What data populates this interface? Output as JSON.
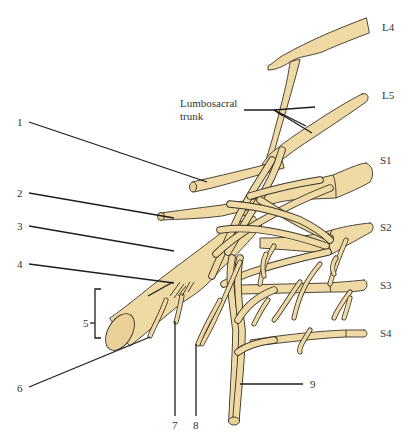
{
  "diagram": {
    "colors": {
      "nerve_fill": "#EFDAA6",
      "nerve_outline": "#3a3326",
      "leader_line": "#1e1e1e",
      "label_text": "#333333",
      "background": "#ffffff"
    },
    "root_labels": [
      {
        "id": "L4",
        "text": "L4"
      },
      {
        "id": "L5",
        "text": "L5"
      },
      {
        "id": "S1",
        "text": "S1"
      },
      {
        "id": "S2",
        "text": "S2"
      },
      {
        "id": "S3",
        "text": "S3"
      },
      {
        "id": "S4",
        "text": "S4"
      }
    ],
    "annotation": {
      "line1": "Lumbosacral",
      "line2": "trunk"
    },
    "numbered_labels": [
      {
        "number": "1"
      },
      {
        "number": "2"
      },
      {
        "number": "3"
      },
      {
        "number": "4"
      },
      {
        "number": "5"
      },
      {
        "number": "6"
      },
      {
        "number": "7"
      },
      {
        "number": "8"
      },
      {
        "number": "9"
      }
    ]
  }
}
